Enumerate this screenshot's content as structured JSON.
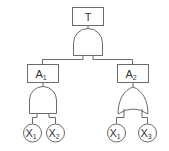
{
  "diagram": {
    "type": "fault-tree",
    "top_event": {
      "label": "T"
    },
    "top_gate": {
      "type": "AND"
    },
    "intermediate_events": [
      {
        "label": "A",
        "subscript": "1",
        "gate": "AND",
        "inputs": [
          {
            "label": "X",
            "subscript": "1"
          },
          {
            "label": "X",
            "subscript": "2"
          }
        ]
      },
      {
        "label": "A",
        "subscript": "2",
        "gate": "OR",
        "inputs": [
          {
            "label": "X",
            "subscript": "1"
          },
          {
            "label": "X",
            "subscript": "3"
          }
        ]
      }
    ]
  },
  "colors": {
    "stroke": "#6b6b6b",
    "text": "#333333",
    "background": "#ffffff"
  }
}
